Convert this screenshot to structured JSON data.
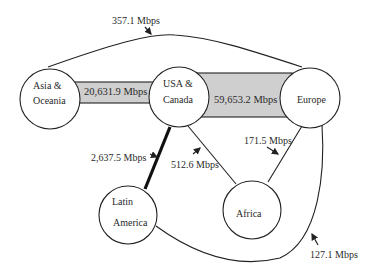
{
  "diagram": {
    "type": "network-bandwidth-map",
    "colors": {
      "background": "#ffffff",
      "stroke": "#222222",
      "band_fill": "#cfcfcf",
      "text": "#2a2a2a"
    },
    "nodes": [
      {
        "id": "asia",
        "line1": "Asia &",
        "line2": "Oceania"
      },
      {
        "id": "usa",
        "line1": "USA &",
        "line2": "Canada"
      },
      {
        "id": "europe",
        "line1": "Europe"
      },
      {
        "id": "latam",
        "line1": "Latin",
        "line2": "America"
      },
      {
        "id": "africa",
        "line1": "Africa"
      }
    ],
    "edges": [
      {
        "id": "asia-europe",
        "from": "Asia & Oceania",
        "to": "Europe",
        "label": "357.1 Mbps",
        "style": "thin-curve"
      },
      {
        "id": "asia-usa",
        "from": "Asia & Oceania",
        "to": "USA & Canada",
        "label": "20,631.9 Mbps",
        "style": "gray-band"
      },
      {
        "id": "usa-europe",
        "from": "USA & Canada",
        "to": "Europe",
        "label": "59,653.2 Mbps",
        "style": "wide-gray-band"
      },
      {
        "id": "usa-latam",
        "from": "USA & Canada",
        "to": "Latin America",
        "label": "2,637.5 Mbps",
        "style": "thick-line"
      },
      {
        "id": "usa-africa",
        "from": "USA & Canada",
        "to": "Africa",
        "label": "512.6 Mbps",
        "style": "thin-line"
      },
      {
        "id": "europe-africa",
        "from": "Europe",
        "to": "Africa",
        "label": "171.5 Mbps",
        "style": "thin-line"
      },
      {
        "id": "europe-latam",
        "from": "Europe",
        "to": "Latin America",
        "label": "127.1 Mbps",
        "style": "thin-curve"
      }
    ]
  }
}
